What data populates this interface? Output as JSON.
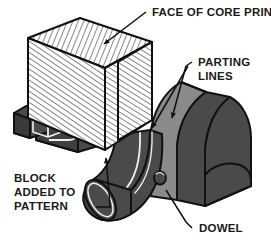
{
  "figure": {
    "background_color": "#ffffff",
    "line_color": "#111111",
    "colors": {
      "hatch_face": "#ffffff",
      "hatch_line": "#1a1a1a",
      "core_dark": "#4a4a4a",
      "core_dark_side": "#3a3a3a",
      "slab_medium": "#8a8a8a",
      "slab_medium_edge": "#6f6f6f",
      "highlight_line": "#f2f2f2",
      "outline": "#111111"
    },
    "callouts": [
      {
        "id": "face-of-core-print",
        "label": "FACE OF CORE PRINT",
        "lines": [
          "FACE OF CORE PRINT"
        ],
        "leader": "line-with-arrowhead",
        "points_to": "top-hatched-face-of-block"
      },
      {
        "id": "parting-lines",
        "label": "PARTING LINES",
        "lines": [
          "PARTING",
          "LINES"
        ],
        "leader": "two-lines-with-arrowheads",
        "points_to": "curved-slab-parting-surfaces"
      },
      {
        "id": "block-added-to-pattern",
        "label": "BLOCK ADDED TO PATTERN",
        "lines": [
          "BLOCK",
          "ADDED TO",
          "PATTERN"
        ],
        "leader": "line-with-arrowhead",
        "points_to": "hatched-block"
      },
      {
        "id": "dowel",
        "label": "DOWEL",
        "lines": [
          "DOWEL"
        ],
        "leader": "elbow-line",
        "points_to": "dowel-pin"
      }
    ],
    "parts": [
      {
        "id": "hatched-block",
        "name": "Block added to pattern",
        "shading": "diagonal hatching"
      },
      {
        "id": "core-body",
        "name": "Core body",
        "shading": "dark gray solid"
      },
      {
        "id": "small-boss",
        "name": "Small boss projection",
        "shading": "dark gray solid"
      },
      {
        "id": "curved-arm",
        "name": "Curved arm",
        "shading": "dark gray solid"
      },
      {
        "id": "cylinder",
        "name": "Cylindrical end",
        "shading": "dark gray solid"
      },
      {
        "id": "parting-slab",
        "name": "Parting surface slab",
        "shading": "medium gray solid"
      },
      {
        "id": "dowel-pin",
        "name": "Dowel pin",
        "shading": "dark gray circle"
      }
    ]
  }
}
